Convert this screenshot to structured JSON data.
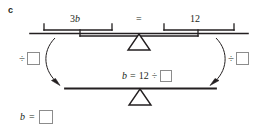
{
  "problem": {
    "part_label": "c",
    "top_balance": {
      "left_brace_label": "3b",
      "left_brace_label_coefficient": "3",
      "left_brace_label_variable": "b",
      "relation": "=",
      "right_brace_label": "12"
    },
    "operations": {
      "left": {
        "symbol": "÷",
        "value": ""
      },
      "right": {
        "symbol": "÷",
        "value": ""
      }
    },
    "bottom_balance": {
      "equation_variable": "b",
      "equation_equals": "=",
      "equation_value": "12",
      "equation_divide": "÷",
      "equation_box_value": ""
    },
    "final_answer": {
      "variable": "b",
      "equals": "=",
      "box_value": ""
    },
    "colors": {
      "ink": "#231f20",
      "box_border": "#8c8c8c",
      "background": "#ffffff"
    }
  }
}
